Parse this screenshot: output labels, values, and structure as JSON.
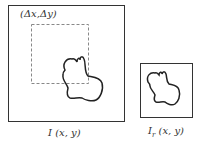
{
  "diagram": {
    "image_label": "I (x, y)",
    "offset_label": "(Δx,Δy)",
    "reference_label_main": "I",
    "reference_label_sub": "r",
    "reference_label_args": " (x, y)",
    "colors": {
      "stroke": "#222222",
      "dashed": "#888888",
      "text": "#333333",
      "background": "#ffffff"
    }
  }
}
